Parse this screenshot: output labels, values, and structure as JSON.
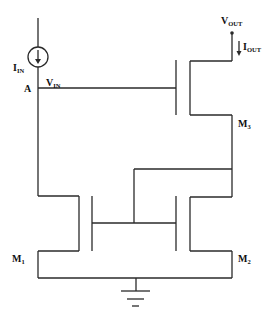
{
  "diagram": {
    "labels": {
      "iin": {
        "main": "I",
        "sub": "IN"
      },
      "node_a": "A",
      "vin": {
        "main": "V",
        "sub": "IN"
      },
      "vout": {
        "main": "V",
        "sub": "OUT"
      },
      "iout": {
        "main": "I",
        "sub": "OUT"
      },
      "m1": {
        "main": "M",
        "sub": "1"
      },
      "m2": {
        "main": "M",
        "sub": "2"
      },
      "m3": {
        "main": "M",
        "sub": "3"
      }
    },
    "components": [
      {
        "id": "current-source",
        "type": "current source",
        "label": "I_IN"
      },
      {
        "id": "M1",
        "type": "nmos",
        "label": "M1"
      },
      {
        "id": "M2",
        "type": "nmos",
        "label": "M2"
      },
      {
        "id": "M3",
        "type": "nmos",
        "label": "M3"
      },
      {
        "id": "ground",
        "type": "ground"
      }
    ],
    "nodes": [
      "A",
      "V_IN",
      "V_OUT"
    ],
    "colors": {
      "line": "#2a2a2a",
      "text": "#111111",
      "background": "#ffffff"
    }
  }
}
